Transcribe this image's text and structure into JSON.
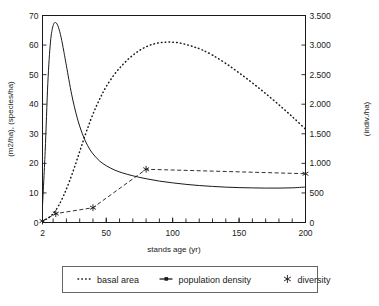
{
  "chart_data": {
    "type": "line",
    "title": "",
    "xlabel": "stands age (yr)",
    "ylabel_left": "(m2/ha), (species/ha)",
    "ylabel_right": "(indiv./ha)",
    "xlim": [
      2,
      200
    ],
    "ylim_left": [
      0,
      70
    ],
    "ylim_right": [
      0,
      3500
    ],
    "grid": false,
    "legend_position": "bottom",
    "x_ticks": [
      2,
      50,
      100,
      150,
      200
    ],
    "x_tick_labels": [
      "2",
      "50",
      "100",
      "150",
      "200"
    ],
    "x_minor_tick_step": 10,
    "y_ticks_left": [
      0,
      10,
      20,
      30,
      40,
      50,
      60,
      70
    ],
    "y_tick_labels_left": [
      "0",
      "10",
      "20",
      "30",
      "40",
      "50",
      "60",
      "70"
    ],
    "y_ticks_right": [
      0,
      500,
      1000,
      1500,
      2000,
      2500,
      3000,
      3500
    ],
    "y_tick_labels_right": [
      "0",
      "500",
      "1.000",
      "1.500",
      "2.000",
      "2.500",
      "3.000",
      "3.500"
    ],
    "series": [
      {
        "name": "basal area",
        "axis": "left",
        "style": "dotted",
        "marker": "none",
        "color": "#1a1a1a",
        "x": [
          2,
          6,
          10,
          14,
          18,
          22,
          26,
          30,
          34,
          38,
          42,
          46,
          50,
          56,
          62,
          68,
          74,
          80,
          86,
          92,
          98,
          104,
          110,
          116,
          122,
          130,
          140,
          150,
          160,
          170,
          180,
          190,
          200
        ],
        "y": [
          0.5,
          1.4,
          3.0,
          5.6,
          9.2,
          13.6,
          18.6,
          24.0,
          29.4,
          34.4,
          38.8,
          42.6,
          46.0,
          50.0,
          53.2,
          55.8,
          57.9,
          59.4,
          60.4,
          60.9,
          61.0,
          60.8,
          60.2,
          59.4,
          58.4,
          56.6,
          53.8,
          50.6,
          47.2,
          43.6,
          39.8,
          35.8,
          31.6
        ]
      },
      {
        "name": "population density",
        "axis": "right",
        "style": "solid",
        "marker": "none",
        "color": "#1a1a1a",
        "x": [
          2,
          4,
          6,
          8,
          10,
          12,
          14,
          16,
          18,
          20,
          24,
          28,
          32,
          36,
          40,
          45,
          50,
          56,
          62,
          70,
          80,
          90,
          100,
          110,
          120,
          130,
          140,
          150,
          160,
          170,
          180,
          190,
          200
        ],
        "y": [
          280,
          1200,
          2350,
          3050,
          3330,
          3380,
          3300,
          3130,
          2900,
          2650,
          2160,
          1780,
          1500,
          1300,
          1160,
          1040,
          960,
          890,
          840,
          790,
          740,
          700,
          670,
          645,
          625,
          610,
          598,
          590,
          585,
          582,
          582,
          586,
          600
        ]
      },
      {
        "name": "diversity",
        "axis": "left",
        "style": "dashed",
        "marker": "asterisk",
        "color": "#1a1a1a",
        "x": [
          2,
          12,
          40,
          80,
          200
        ],
        "y": [
          0.5,
          3.0,
          5.0,
          18.0,
          16.5
        ]
      }
    ]
  },
  "legend": {
    "items": [
      {
        "label": "basal area",
        "marker": "dotted-line"
      },
      {
        "label": "population density",
        "marker": "solid-line"
      },
      {
        "label": "diversity",
        "marker": "asterisk"
      }
    ]
  }
}
